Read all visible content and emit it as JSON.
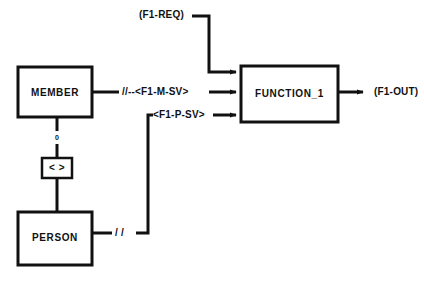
{
  "diagram": {
    "background_color": "#ffffff",
    "line_color": "#111111",
    "entities": [
      {
        "id": "member",
        "label": "MEMBER"
      },
      {
        "id": "person",
        "label": "PERSON"
      }
    ],
    "relationship": {
      "id": "member-person-relationship",
      "label": "< >",
      "cardinality_marker": "0"
    },
    "process": {
      "id": "function-1",
      "label": "FUNCTION_1"
    },
    "flows": [
      {
        "id": "f1-req",
        "label": "(F1-REQ)",
        "kind": "external-input",
        "target": "FUNCTION_1"
      },
      {
        "id": "f1-m-sv",
        "label": "//--<F1-M-SV>",
        "kind": "entity-view",
        "source": "MEMBER",
        "target": "FUNCTION_1"
      },
      {
        "id": "f1-p-sv",
        "label": "<F1-P-SV>",
        "kind": "entity-view",
        "source": "PERSON",
        "target": "FUNCTION_1"
      },
      {
        "id": "person-slashes",
        "label": "/ /",
        "kind": "path-marker",
        "source": "PERSON"
      },
      {
        "id": "f1-out",
        "label": "(F1-OUT)",
        "kind": "external-output",
        "source": "FUNCTION_1"
      }
    ]
  }
}
